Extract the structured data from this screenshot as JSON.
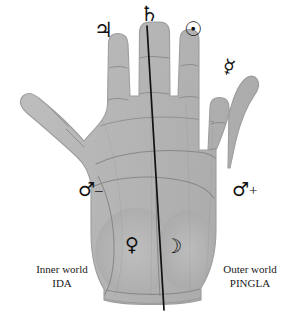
{
  "figure": {
    "background_color": "#ffffff",
    "skin_color": "#cccccc",
    "line_color": "#111111"
  },
  "hand": {
    "description": "Left palm, fingers up, thumb extending to the left",
    "divider_line_label": "central dividing line"
  },
  "mounts": [
    {
      "id": "jupiter",
      "symbol": "♃",
      "sign": "",
      "name": "Jupiter",
      "finger": "index"
    },
    {
      "id": "saturn",
      "symbol": "♄",
      "sign": "",
      "name": "Saturn",
      "finger": "middle"
    },
    {
      "id": "sun",
      "symbol": "☉",
      "sign": "",
      "name": "Sun",
      "finger": "ring"
    },
    {
      "id": "mercury",
      "symbol": "☿",
      "sign": "",
      "name": "Mercury",
      "finger": "little"
    },
    {
      "id": "mars_negative",
      "symbol": "♂",
      "sign": "–",
      "name": "Mars negative",
      "finger": ""
    },
    {
      "id": "mars_positive",
      "symbol": "♂",
      "sign": "+",
      "name": "Mars positive",
      "finger": ""
    },
    {
      "id": "venus",
      "symbol": "♀",
      "sign": "",
      "name": "Venus",
      "finger": ""
    },
    {
      "id": "moon",
      "symbol": "☽",
      "sign": "",
      "name": "Moon",
      "finger": ""
    }
  ],
  "captions": {
    "inner": {
      "line1": "Inner world",
      "line2": "IDA"
    },
    "outer": {
      "line1": "Outer world",
      "line2": "PINGLA"
    }
  }
}
